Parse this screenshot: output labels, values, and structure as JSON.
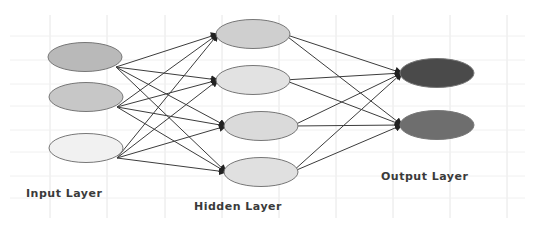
{
  "diagram": {
    "type": "neural-network",
    "layers": [
      {
        "name": "input",
        "label": "Input Layer",
        "nodes": [
          {
            "id": "i1",
            "fill": "#b9b9b9"
          },
          {
            "id": "i2",
            "fill": "#c7c7c7"
          },
          {
            "id": "i3",
            "fill": "#f1f1f1"
          }
        ]
      },
      {
        "name": "hidden",
        "label": "Hidden Layer",
        "nodes": [
          {
            "id": "h1",
            "fill": "#cfcfcf"
          },
          {
            "id": "h2",
            "fill": "#e2e2e2"
          },
          {
            "id": "h3",
            "fill": "#dadada"
          },
          {
            "id": "h4",
            "fill": "#e0e0e0"
          }
        ]
      },
      {
        "name": "output",
        "label": "Output Layer",
        "nodes": [
          {
            "id": "o1",
            "fill": "#4a4a4a"
          },
          {
            "id": "o2",
            "fill": "#6e6e6e"
          }
        ]
      }
    ],
    "connections": "fully-connected",
    "colors": {
      "edge": "#3c3c3c",
      "node_stroke": "#777777",
      "grid": "#e6e6e6",
      "label": "#3a3a3a"
    }
  }
}
